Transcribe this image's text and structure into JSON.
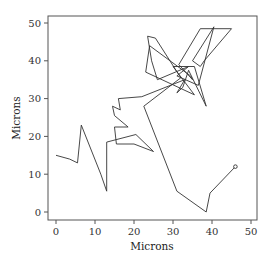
{
  "chart_data": {
    "type": "line",
    "title": "",
    "xlabel": "Microns",
    "ylabel": "Microns",
    "xlim": [
      -2,
      52
    ],
    "ylim": [
      -2,
      52
    ],
    "xticks": [
      0,
      10,
      20,
      30,
      40,
      50
    ],
    "yticks": [
      0,
      10,
      20,
      30,
      40,
      50
    ],
    "grid": false,
    "legend": null,
    "series": [
      {
        "name": "trajectory",
        "end_marker": "open-circle",
        "points": [
          [
            0,
            15
          ],
          [
            5,
            18
          ],
          [
            7,
            23
          ],
          [
            12,
            10
          ],
          [
            13,
            5.5
          ],
          [
            13,
            18.5
          ],
          [
            24.5,
            8.5
          ],
          [
            31,
            5.5
          ],
          [
            38.5,
            0
          ],
          [
            39.5,
            5
          ],
          [
            46,
            12
          ]
        ],
        "x": [
          0,
          3.5,
          5.5,
          6.5,
          11.5,
          13,
          13,
          20.5,
          25,
          20,
          15.5,
          15,
          18.5,
          15,
          14.5,
          16.5,
          16,
          22,
          33,
          31,
          32.5,
          34,
          38.5,
          35.5,
          30,
          35.5,
          23,
          24,
          34.5,
          35,
          31.5,
          37,
          45,
          38,
          37,
          35,
          40.5,
          36.5,
          31,
          34,
          26,
          24.5,
          23.5,
          25.5,
          32,
          22.5,
          31,
          38.5,
          39.5,
          46
        ],
        "y": [
          15,
          14,
          13,
          23,
          10,
          5.5,
          18.5,
          20.5,
          16,
          18,
          18,
          22.5,
          22.5,
          25.5,
          28,
          27,
          30,
          30.5,
          35,
          31.5,
          33,
          37.5,
          28,
          38.5,
          38.5,
          31,
          37,
          44,
          36,
          35,
          39,
          48.5,
          48.5,
          40,
          38.5,
          40,
          49,
          33.5,
          36,
          38.5,
          35,
          40,
          46.5,
          46,
          35.5,
          28,
          5.5,
          0,
          5,
          12
        ]
      }
    ]
  }
}
